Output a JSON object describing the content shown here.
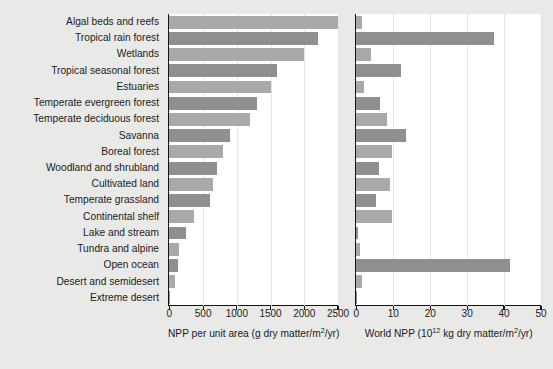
{
  "chart_data": {
    "type": "bar",
    "title": "",
    "orientation": "horizontal",
    "categories": [
      "Algal beds and reefs",
      "Tropical rain forest",
      "Wetlands",
      "Tropical seasonal forest",
      "Estuaries",
      "Temperate evergreen forest",
      "Temperate deciduous forest",
      "Savanna",
      "Boreal forest",
      "Woodland and shrubland",
      "Cultivated land",
      "Temperate grassland",
      "Continental shelf",
      "Lake and stream",
      "Tundra and alpine",
      "Open ocean",
      "Desert and semidesert",
      "Extreme desert"
    ],
    "panels": [
      {
        "id": "npp-per-unit-area",
        "xlabel": "NPP per unit area (g dry matter/m²/yr)",
        "xlabel_prefix": "NPP per unit area (g dry matter/m",
        "xlabel_sup": "2",
        "xlabel_suffix": "/yr)",
        "xlim": [
          0,
          2500
        ],
        "ticks": [
          0,
          500,
          1000,
          1500,
          2000,
          2500
        ],
        "ticklabels": [
          "0",
          "500",
          "1000",
          "1500",
          "2000",
          "2500"
        ],
        "values": [
          2500,
          2200,
          2000,
          1600,
          1500,
          1300,
          1200,
          900,
          800,
          700,
          650,
          600,
          360,
          250,
          140,
          125,
          90,
          3
        ]
      },
      {
        "id": "world-npp",
        "xlabel": "World NPP (10¹² kg dry matter/m²/yr)",
        "xlabel_prefix": "World NPP (10",
        "xlabel_sup": "12",
        "xlabel_mid": " kg dry matter/m",
        "xlabel_sup2": "2",
        "xlabel_suffix": "/yr)",
        "xlim": [
          0,
          50
        ],
        "ticks": [
          0,
          10,
          20,
          30,
          40,
          50
        ],
        "ticklabels": [
          "0",
          "10",
          "20",
          "30",
          "40",
          "50"
        ],
        "values": [
          1.6,
          37.4,
          4.0,
          12.0,
          2.1,
          6.5,
          8.4,
          13.5,
          9.6,
          6.0,
          9.1,
          5.4,
          9.6,
          0.5,
          1.1,
          41.5,
          1.6,
          0.07
        ]
      }
    ],
    "bar_colors": [
      "#a9a9a9",
      "#8f8f8f"
    ],
    "grid": true,
    "legend": null
  }
}
